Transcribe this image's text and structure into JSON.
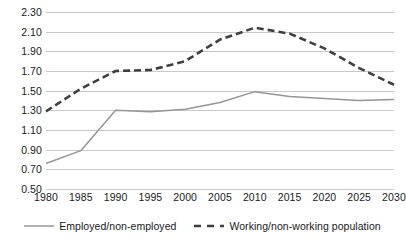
{
  "chart_data": {
    "type": "line",
    "title": "",
    "xlabel": "",
    "ylabel": "",
    "categories": [
      "1980",
      "1985",
      "1990",
      "1995",
      "2000",
      "2005",
      "2010",
      "2015",
      "2020",
      "2025",
      "2030"
    ],
    "ylim": [
      0.5,
      2.3
    ],
    "ytick_labels": [
      "2.30",
      "2.10",
      "1.90",
      "1.70",
      "1.50",
      "1.30",
      "1.10",
      "0.90",
      "0.70",
      "0.50"
    ],
    "ytick_values": [
      2.3,
      2.1,
      1.9,
      1.7,
      1.5,
      1.3,
      1.1,
      0.9,
      0.7,
      0.5
    ],
    "grid": true,
    "legend_position": "bottom",
    "series": [
      {
        "name": "Employed/non-employed",
        "style": "solid",
        "color": "#969696",
        "values": [
          0.76,
          0.89,
          1.3,
          1.285,
          1.31,
          1.38,
          1.49,
          1.44,
          1.42,
          1.4,
          1.41
        ]
      },
      {
        "name": "Working/non-working population",
        "style": "dashed",
        "color": "#3f3f3f",
        "values": [
          1.29,
          1.52,
          1.7,
          1.71,
          1.8,
          2.02,
          2.14,
          2.08,
          1.93,
          1.73,
          1.56
        ]
      }
    ]
  },
  "colors": {
    "gridline": "#c9c9c9",
    "text": "#1a1a1a",
    "background": "#ffffff",
    "series_solid": "#969696",
    "series_dashed": "#3f3f3f"
  }
}
